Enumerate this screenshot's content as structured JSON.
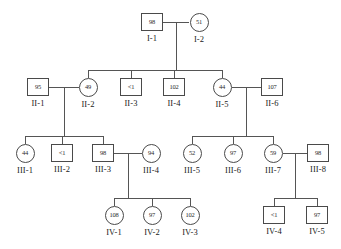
{
  "chart_data": {
    "type": "diagram",
    "title": "",
    "diagram_kind": "pedigree",
    "generations": [
      "I",
      "II",
      "III",
      "IV"
    ],
    "legend": {
      "square_meaning": "male",
      "circle_meaning": "female",
      "value_meaning": "measured value shown inside symbol"
    },
    "individuals": [
      {
        "id": "I-1",
        "label": "I-1",
        "value": "98",
        "sex": "male",
        "shape": "square",
        "generation": "I",
        "cx": 152,
        "cy": 22
      },
      {
        "id": "I-2",
        "label": "I-2",
        "value": "51",
        "sex": "female",
        "shape": "circle",
        "generation": "I",
        "cx": 199,
        "cy": 22
      },
      {
        "id": "II-1",
        "label": "II-1",
        "value": "95",
        "sex": "male",
        "shape": "square",
        "generation": "II",
        "cx": 38,
        "cy": 87
      },
      {
        "id": "II-2",
        "label": "II-2",
        "value": "49",
        "sex": "female",
        "shape": "circle",
        "generation": "II",
        "cx": 88,
        "cy": 87
      },
      {
        "id": "II-3",
        "label": "II-3",
        "value": "<1",
        "sex": "male",
        "shape": "square",
        "generation": "II",
        "cx": 131,
        "cy": 87
      },
      {
        "id": "II-4",
        "label": "II-4",
        "value": "102",
        "sex": "male",
        "shape": "square",
        "generation": "II",
        "cx": 174,
        "cy": 87
      },
      {
        "id": "II-5",
        "label": "II-5",
        "value": "44",
        "sex": "female",
        "shape": "circle",
        "generation": "II",
        "cx": 222,
        "cy": 87
      },
      {
        "id": "II-6",
        "label": "II-6",
        "value": "107",
        "sex": "male",
        "shape": "square",
        "generation": "II",
        "cx": 272,
        "cy": 87
      },
      {
        "id": "III-1",
        "label": "III-1",
        "value": "44",
        "sex": "female",
        "shape": "circle",
        "generation": "III",
        "cx": 25,
        "cy": 153
      },
      {
        "id": "III-2",
        "label": "III-2",
        "value": "<1",
        "sex": "male",
        "shape": "square",
        "generation": "III",
        "cx": 62,
        "cy": 153
      },
      {
        "id": "III-3",
        "label": "III-3",
        "value": "98",
        "sex": "male",
        "shape": "square",
        "generation": "III",
        "cx": 103,
        "cy": 153
      },
      {
        "id": "III-4",
        "label": "III-4",
        "value": "94",
        "sex": "female",
        "shape": "circle",
        "generation": "III",
        "cx": 151,
        "cy": 153
      },
      {
        "id": "III-5",
        "label": "III-5",
        "value": "52",
        "sex": "female",
        "shape": "circle",
        "generation": "III",
        "cx": 192,
        "cy": 153
      },
      {
        "id": "III-6",
        "label": "III-6",
        "value": "97",
        "sex": "female",
        "shape": "circle",
        "generation": "III",
        "cx": 233,
        "cy": 153
      },
      {
        "id": "III-7",
        "label": "III-7",
        "value": "59",
        "sex": "female",
        "shape": "circle",
        "generation": "III",
        "cx": 273,
        "cy": 153
      },
      {
        "id": "III-8",
        "label": "III-8",
        "value": "98",
        "sex": "male",
        "shape": "square",
        "generation": "III",
        "cx": 318,
        "cy": 153
      },
      {
        "id": "IV-1",
        "label": "IV-1",
        "value": "108",
        "sex": "female",
        "shape": "circle",
        "generation": "IV",
        "cx": 114,
        "cy": 215
      },
      {
        "id": "IV-2",
        "label": "IV-2",
        "value": "97",
        "sex": "female",
        "shape": "circle",
        "generation": "IV",
        "cx": 152,
        "cy": 215
      },
      {
        "id": "IV-3",
        "label": "IV-3",
        "value": "102",
        "sex": "female",
        "shape": "circle",
        "generation": "IV",
        "cx": 190,
        "cy": 215
      },
      {
        "id": "IV-4",
        "label": "IV-4",
        "value": "<1",
        "sex": "male",
        "shape": "square",
        "generation": "IV",
        "cx": 274,
        "cy": 215
      },
      {
        "id": "IV-5",
        "label": "IV-5",
        "value": "97",
        "sex": "male",
        "shape": "square",
        "generation": "IV",
        "cx": 317,
        "cy": 215
      }
    ],
    "matings": [
      {
        "partners": [
          "I-1",
          "I-2"
        ],
        "children": [
          "II-2",
          "II-3",
          "II-4",
          "II-5"
        ]
      },
      {
        "partners": [
          "II-1",
          "II-2"
        ],
        "children": [
          "III-1",
          "III-2",
          "III-3"
        ]
      },
      {
        "partners": [
          "II-5",
          "II-6"
        ],
        "children": [
          "III-5",
          "III-6",
          "III-7"
        ]
      },
      {
        "partners": [
          "III-3",
          "III-4"
        ],
        "children": [
          "IV-1",
          "IV-2",
          "IV-3"
        ]
      },
      {
        "partners": [
          "III-7",
          "III-8"
        ],
        "children": [
          "IV-4",
          "IV-5"
        ]
      }
    ]
  },
  "colors": {
    "stroke": "#4a4a4a",
    "line": "#555555",
    "text": "#1a1a1a",
    "background": "#ffffff"
  }
}
